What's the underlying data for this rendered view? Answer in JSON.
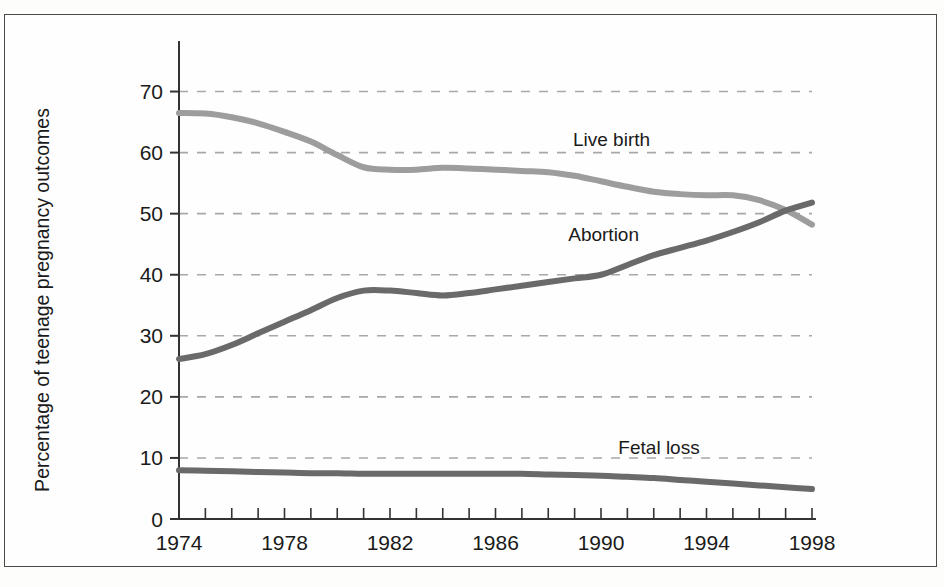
{
  "chart_data": {
    "type": "line",
    "title": "",
    "xlabel": "",
    "ylabel": "Percentage of teenage pregnancy outcomes",
    "xlim": [
      1974,
      1998
    ],
    "ylim": [
      0,
      75
    ],
    "grid": true,
    "legend_position": "inline-labels",
    "x_tick_labels": [
      "1974",
      "1978",
      "1982",
      "1986",
      "1990",
      "1994",
      "1998"
    ],
    "x_tick_values": [
      1974,
      1978,
      1982,
      1986,
      1990,
      1994,
      1998
    ],
    "x_minor_ticks": [
      1974,
      1975,
      1976,
      1977,
      1978,
      1979,
      1980,
      1981,
      1982,
      1983,
      1984,
      1985,
      1986,
      1987,
      1988,
      1989,
      1990,
      1991,
      1992,
      1993,
      1994,
      1995,
      1996,
      1997,
      1998
    ],
    "y_tick_labels": [
      "0",
      "10",
      "20",
      "30",
      "40",
      "50",
      "60",
      "70"
    ],
    "y_tick_values": [
      0,
      10,
      20,
      30,
      40,
      50,
      60,
      70
    ],
    "y_gridline_values": [
      10,
      20,
      30,
      40,
      50,
      60,
      70
    ],
    "x": [
      1974,
      1975,
      1976,
      1977,
      1978,
      1979,
      1980,
      1981,
      1982,
      1983,
      1984,
      1985,
      1986,
      1987,
      1988,
      1989,
      1990,
      1991,
      1992,
      1993,
      1994,
      1995,
      1996,
      1997,
      1998
    ],
    "series": [
      {
        "name": "Live birth",
        "label": "Live birth",
        "color": "#9d9d9d",
        "label_x": 1990.4,
        "label_y": 61.0,
        "values": [
          66.5,
          66.4,
          65.8,
          64.8,
          63.4,
          61.8,
          59.6,
          57.6,
          57.2,
          57.2,
          57.5,
          57.4,
          57.2,
          57.0,
          56.8,
          56.2,
          55.3,
          54.4,
          53.6,
          53.2,
          53.0,
          53.0,
          52.2,
          50.6,
          48.2
        ]
      },
      {
        "name": "Abortion",
        "label": "Abortion",
        "color": "#6a6a6a",
        "label_x": 1990.1,
        "label_y": 45.6,
        "values": [
          26.2,
          27.0,
          28.5,
          30.4,
          32.3,
          34.2,
          36.2,
          37.4,
          37.4,
          37.0,
          36.6,
          37.0,
          37.6,
          38.2,
          38.8,
          39.4,
          40.0,
          41.6,
          43.2,
          44.4,
          45.6,
          47.0,
          48.6,
          50.5,
          51.8
        ]
      },
      {
        "name": "Fetal loss",
        "label": "Fetal loss",
        "color": "#6a6a6a",
        "label_x": 1992.2,
        "label_y": 10.6,
        "values": [
          8.0,
          7.9,
          7.8,
          7.7,
          7.6,
          7.5,
          7.5,
          7.4,
          7.4,
          7.4,
          7.4,
          7.4,
          7.4,
          7.4,
          7.3,
          7.2,
          7.1,
          6.9,
          6.7,
          6.4,
          6.1,
          5.8,
          5.5,
          5.2,
          4.9
        ]
      }
    ]
  }
}
